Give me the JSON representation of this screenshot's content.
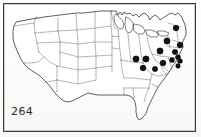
{
  "plate": {
    "number_label": "264",
    "caption": "",
    "frame_color": "#3a3a38",
    "background_color": "#fdfdfb",
    "ink_color": "#2b2b29",
    "dot_color": "#121210"
  },
  "map": {
    "region_label": "contiguous united states",
    "outline_style": "solid",
    "state_border_style": "dashed",
    "lakes_shown": true
  },
  "chart_data": {
    "type": "scatter",
    "title": "264",
    "xlabel": "",
    "ylabel": "",
    "xlim": [
      0,
      201
    ],
    "ylim": [
      0,
      137
    ],
    "grid": false,
    "legend": "none",
    "series": [
      {
        "name": "occurrence records",
        "marker": "filled-circle",
        "color": "#121210",
        "points": [
          {
            "x": 176,
            "y": 28,
            "radius": 3.0,
            "region": "northern New England"
          },
          {
            "x": 167,
            "y": 41,
            "radius": 3.2,
            "region": "New York / New England"
          },
          {
            "x": 180,
            "y": 45,
            "radius": 3.0,
            "region": "southern New England"
          },
          {
            "x": 160,
            "y": 51,
            "radius": 3.2,
            "region": "central New York"
          },
          {
            "x": 175,
            "y": 52,
            "radius": 2.8,
            "region": "lower Hudson"
          },
          {
            "x": 178,
            "y": 57,
            "radius": 2.6,
            "region": "New Jersey"
          },
          {
            "x": 180,
            "y": 61,
            "radius": 2.5,
            "region": "Delmarva north"
          },
          {
            "x": 172,
            "y": 60,
            "radius": 2.6,
            "region": "eastern Pennsylvania"
          },
          {
            "x": 178,
            "y": 66,
            "radius": 2.4,
            "region": "Chesapeake"
          },
          {
            "x": 163,
            "y": 63,
            "radius": 3.0,
            "region": "western Pennsylvania"
          },
          {
            "x": 146,
            "y": 59,
            "radius": 3.2,
            "region": "Indiana / Ohio"
          },
          {
            "x": 136,
            "y": 59,
            "radius": 3.2,
            "region": "Illinois east"
          },
          {
            "x": 143,
            "y": 68,
            "radius": 3.0,
            "region": "Kentucky"
          },
          {
            "x": 155,
            "y": 69,
            "radius": 2.8,
            "region": "West Virginia / Virginia"
          }
        ]
      }
    ]
  }
}
